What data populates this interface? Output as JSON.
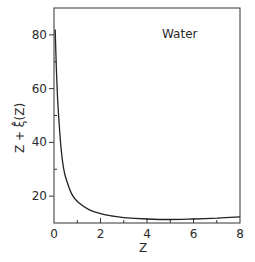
{
  "chart_data": {
    "type": "line",
    "title": "",
    "annotation": "Water",
    "xlabel": "Z",
    "ylabel": "Z + ξ̂(Z)",
    "xlim": [
      0,
      8
    ],
    "ylim": [
      10,
      90
    ],
    "x_ticks": [
      0,
      2,
      4,
      6,
      8
    ],
    "x_tick_labels": [
      "0",
      "2",
      "4",
      "6",
      "8"
    ],
    "x_minor_ticks": [
      1,
      3,
      5,
      7
    ],
    "y_ticks": [
      20,
      40,
      60,
      80
    ],
    "y_tick_labels": [
      "20",
      "40",
      "60",
      "80"
    ],
    "y_minor_ticks": [
      30,
      50,
      70
    ],
    "grid": false,
    "legend": null,
    "series": [
      {
        "name": "Water",
        "x": [
          0.05,
          0.1,
          0.15,
          0.2,
          0.3,
          0.4,
          0.5,
          0.75,
          1.0,
          1.5,
          2.0,
          2.5,
          3.0,
          4.0,
          5.0,
          6.0,
          7.0,
          8.0
        ],
        "y": [
          82,
          68,
          57,
          50,
          38,
          31,
          27,
          21,
          18,
          15,
          13.5,
          12.6,
          12.0,
          11.5,
          11.3,
          11.5,
          11.8,
          12.3
        ]
      }
    ],
    "colors": {
      "line": "#222222",
      "axis": "#333333",
      "background": "#ffffff"
    }
  }
}
